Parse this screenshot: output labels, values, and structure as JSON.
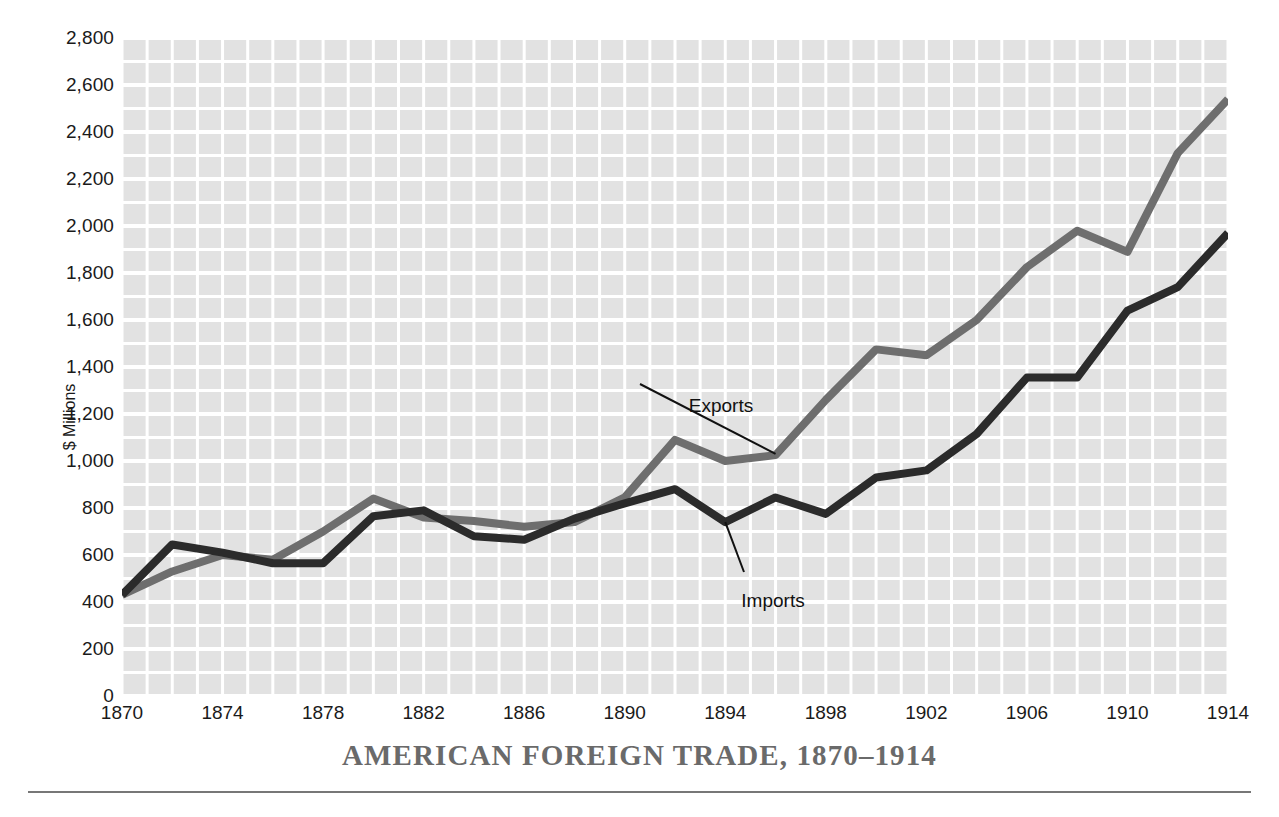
{
  "chart_data": {
    "type": "line",
    "title": "AMERICAN FOREIGN TRADE, 1870–1914",
    "xlabel": "",
    "ylabel": "$ Millions",
    "xlim": [
      1870,
      1914
    ],
    "ylim": [
      0,
      2800
    ],
    "grid": true,
    "legend_position": "inline-annotations",
    "y_ticks": [
      0,
      200,
      400,
      600,
      800,
      1000,
      1200,
      1400,
      1600,
      1800,
      2000,
      2200,
      2400,
      2600,
      2800
    ],
    "y_tick_labels": [
      "0",
      "200",
      "400",
      "600",
      "800",
      "1,000",
      "1,200",
      "1,400",
      "1,600",
      "1,800",
      "2,000",
      "2,200",
      "2,400",
      "2,600",
      "2,800"
    ],
    "x_ticks": [
      1870,
      1874,
      1878,
      1882,
      1886,
      1890,
      1894,
      1898,
      1902,
      1906,
      1910,
      1914
    ],
    "x_tick_labels": [
      "1870",
      "1874",
      "1878",
      "1882",
      "1886",
      "1890",
      "1894",
      "1898",
      "1902",
      "1906",
      "1910",
      "1914"
    ],
    "x": [
      1870,
      1872,
      1874,
      1876,
      1878,
      1880,
      1882,
      1884,
      1886,
      1888,
      1890,
      1892,
      1894,
      1896,
      1898,
      1900,
      1902,
      1904,
      1906,
      1908,
      1910,
      1912,
      1914
    ],
    "series": [
      {
        "name": "Exports",
        "color": "#6e6e6e",
        "values": [
          430,
          530,
          600,
          580,
          700,
          840,
          760,
          745,
          720,
          740,
          845,
          1090,
          1000,
          1025,
          1260,
          1475,
          1450,
          1600,
          1825,
          1980,
          1890,
          2310,
          2540
        ]
      },
      {
        "name": "Imports",
        "color": "#2b2b2b",
        "values": [
          430,
          645,
          610,
          565,
          565,
          765,
          790,
          680,
          665,
          755,
          820,
          880,
          740,
          845,
          775,
          930,
          960,
          1115,
          1355,
          1355,
          1640,
          1740,
          1970
        ]
      }
    ],
    "annotations": [
      {
        "label": "Exports",
        "target_x": 1896,
        "target_y": 1030
      },
      {
        "label": "Imports",
        "target_x": 1894,
        "target_y": 740
      }
    ]
  },
  "axis": {
    "y_title": "$ Millions"
  },
  "colors": {
    "exports": "#6e6e6e",
    "imports": "#2b2b2b",
    "plot_background": "#e2e2e2",
    "gridline": "#ffffff",
    "title": "#6a6a6a",
    "rule": "#777777"
  }
}
